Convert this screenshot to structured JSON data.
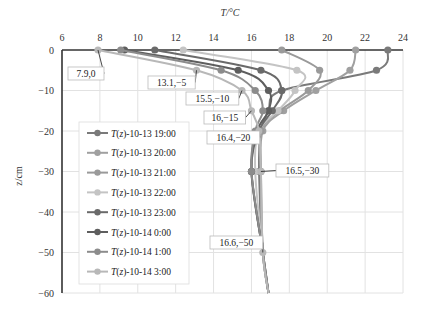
{
  "chart_data": {
    "type": "line",
    "title": "",
    "xlabel": "T/°C",
    "ylabel": "z/cm",
    "xlim": [
      6,
      24
    ],
    "ylim": [
      -60,
      0
    ],
    "x_ticks": [
      "6",
      "8",
      "10",
      "12",
      "14",
      "16",
      "18",
      "20",
      "22",
      "24"
    ],
    "y_ticks": [
      "0",
      "−10",
      "−20",
      "−30",
      "−40",
      "−50",
      "−60"
    ],
    "x_axis_position": "top",
    "grid": true,
    "legend_position": "left-bottom inside",
    "z": [
      0,
      -5,
      -10,
      -15,
      -20,
      -30,
      -50,
      -60
    ],
    "series": [
      {
        "name": "T(z)-10-13 19:00",
        "color": "#7a7a7a",
        "values": [
          23.2,
          22.6,
          17.6,
          16.9,
          16.5,
          16.4,
          16.6,
          16.9
        ]
      },
      {
        "name": "T(z)-10-13 20:00",
        "color": "#a0a0a0",
        "values": [
          21.5,
          21.2,
          19.4,
          17.7,
          16.6,
          16.5,
          16.6,
          16.9
        ]
      },
      {
        "name": "T(z)-10-13 21:00",
        "color": "#9a9a9a",
        "values": [
          17.6,
          19.6,
          19.0,
          17.5,
          16.5,
          16.5,
          16.6,
          16.9
        ]
      },
      {
        "name": "T(z)-10-13 22:00",
        "color": "#c4c4c4",
        "values": [
          12.4,
          18.4,
          18.3,
          17.4,
          16.4,
          16.2,
          16.6,
          16.9
        ]
      },
      {
        "name": "T(z)-10-13 23:00",
        "color": "#6a6a6a",
        "values": [
          10.9,
          16.5,
          17.6,
          17.1,
          16.4,
          16.0,
          16.6,
          16.9
        ]
      },
      {
        "name": "T(z)-10-14 0:00",
        "color": "#5e5e5e",
        "values": [
          9.3,
          15.3,
          16.9,
          16.9,
          16.3,
          16.0,
          16.6,
          16.9
        ]
      },
      {
        "name": "T(z)-10-14 1:00",
        "color": "#8c8c8c",
        "values": [
          9.1,
          14.4,
          16.2,
          16.6,
          16.2,
          16.0,
          16.6,
          16.9
        ]
      },
      {
        "name": "T(z)-10-14 3:00",
        "color": "#b8b8b8",
        "values": [
          7.9,
          13.1,
          15.5,
          16.0,
          16.4,
          16.5,
          16.6,
          16.9
        ]
      }
    ],
    "annotations": [
      {
        "label": "7.9,0",
        "x": 7.9,
        "z": 0
      },
      {
        "label": "13.1,−5",
        "x": 13.1,
        "z": -5
      },
      {
        "label": "15.5,−10",
        "x": 15.5,
        "z": -10
      },
      {
        "label": "16,−15",
        "x": 16,
        "z": -15
      },
      {
        "label": "16.4,−20",
        "x": 16.4,
        "z": -20
      },
      {
        "label": "16.5,−30",
        "x": 16.5,
        "z": -30
      },
      {
        "label": "16.6,−50",
        "x": 16.6,
        "z": -50
      }
    ]
  }
}
